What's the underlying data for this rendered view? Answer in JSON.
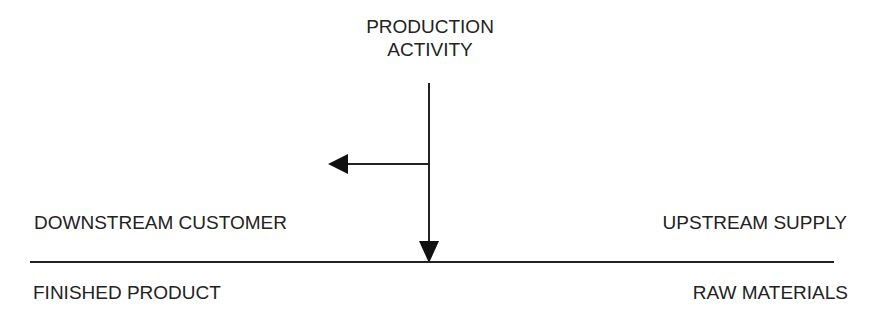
{
  "diagram": {
    "title_lines": [
      "PRODUCTION",
      "ACTIVITY"
    ],
    "left_upper_label": "DOWNSTREAM CUSTOMER",
    "left_lower_label": "FINISHED PRODUCT",
    "right_upper_label": "UPSTREAM SUPPLY",
    "right_lower_label": "RAW MATERIALS",
    "arrows": [
      {
        "name": "production-flow-down",
        "direction": "down",
        "from": "PRODUCTION ACTIVITY",
        "to": "baseline"
      },
      {
        "name": "flow-left-branch",
        "direction": "left",
        "toward": "DOWNSTREAM CUSTOMER"
      }
    ],
    "colors": {
      "ink": "#222222",
      "background": "#ffffff"
    }
  }
}
